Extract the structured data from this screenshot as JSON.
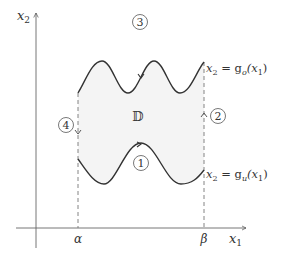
{
  "diagram": {
    "axes": {
      "x_label": "x",
      "x_label_sub": "1",
      "y_label": "x",
      "y_label_sub": "2"
    },
    "bounds": {
      "left": "α",
      "right": "β"
    },
    "region": {
      "label": "𝔻",
      "fill_color": "#f4f4f4"
    },
    "curves": {
      "upper": {
        "label_prefix": "x",
        "label_prefix_sub": "2",
        "label_eq": " = g",
        "label_func_sub": "o",
        "label_arg": "(x",
        "label_arg_sub": "1",
        "label_close": ")"
      },
      "lower": {
        "label_prefix": "x",
        "label_prefix_sub": "2",
        "label_eq": " = g",
        "label_func_sub": "u",
        "label_arg": "(x",
        "label_arg_sub": "1",
        "label_close": ")"
      }
    },
    "boundary_parts": [
      {
        "id": "1",
        "label": "1",
        "description": "lower curve, oriented left to right"
      },
      {
        "id": "2",
        "label": "2",
        "description": "right vertical segment at β, oriented upward"
      },
      {
        "id": "3",
        "label": "3",
        "description": "upper curve, oriented right to left"
      },
      {
        "id": "4",
        "label": "4",
        "description": "left vertical segment at α, oriented downward"
      }
    ],
    "colors": {
      "stroke": "#333333",
      "dashed": "#777777",
      "fill": "#f4f4f4"
    }
  }
}
